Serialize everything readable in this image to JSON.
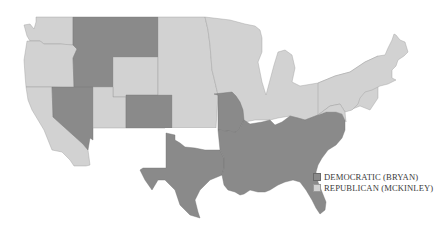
{
  "map": {
    "title": "1896 United States presidential election results",
    "colors": {
      "democratic": "#8a8a8a",
      "republican": "#d2d2d2",
      "background": "#ffffff"
    },
    "states": {
      "democratic": [
        "Idaho",
        "Montana",
        "Nevada",
        "Colorado",
        "Missouri",
        "Arkansas",
        "Louisiana",
        "Texas",
        "Mississippi",
        "Alabama",
        "Georgia",
        "Florida",
        "Tennessee",
        "South Carolina",
        "North Carolina",
        "Virginia"
      ],
      "republican": [
        "Washington",
        "Oregon",
        "California",
        "Wyoming",
        "Utah",
        "North Dakota",
        "South Dakota",
        "Nebraska",
        "Kansas",
        "Minnesota",
        "Iowa",
        "Wisconsin",
        "Illinois",
        "Michigan",
        "Indiana",
        "Ohio",
        "Kentucky",
        "West Virginia",
        "Pennsylvania",
        "New York",
        "Vermont",
        "New Hampshire",
        "Maine",
        "Massachusetts",
        "Connecticut",
        "Rhode Island",
        "New Jersey",
        "Delaware",
        "Maryland"
      ]
    }
  },
  "legend": {
    "items": [
      {
        "label": "DEMOCRATIC (BRYAN)",
        "party": "democratic"
      },
      {
        "label": "REPUBLICAN (MCKINLEY)",
        "party": "republican"
      }
    ]
  }
}
